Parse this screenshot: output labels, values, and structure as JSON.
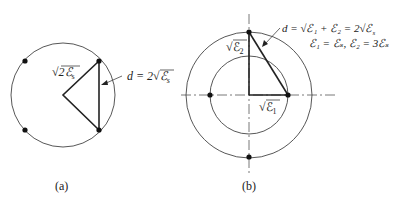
{
  "diagram_a": {
    "caption": "(a)",
    "radius_label_prefix": "√",
    "radius_label": "2ℰ",
    "radius_label_sub": "s",
    "distance_label": "d = 2√ℰ",
    "distance_label_sub": "s"
  },
  "diagram_b": {
    "caption": "(b)",
    "label_e2": "√ℰ",
    "label_e2_sub": "2",
    "label_e1": "√ℰ",
    "label_e1_sub": "1",
    "equation_line1": "d = √ℰ₁ + ℰ₂ = 2√ℰ",
    "equation_line1_sub": "s",
    "equation_line2": "ℰ₁ = ℰₛ, ℰ₂ = 3ℰₛ"
  },
  "colors": {
    "stroke": "#222222",
    "thin_stroke": "#444444",
    "background": "#ffffff"
  }
}
